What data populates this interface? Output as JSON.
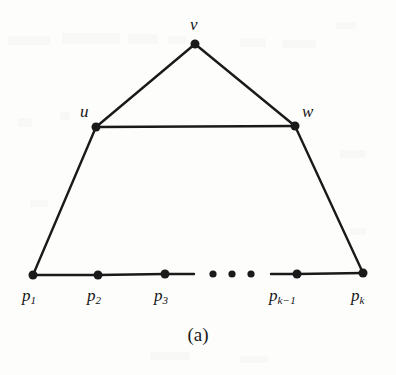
{
  "figure": {
    "caption": "(a)",
    "background_color": "#fdfdfc",
    "ink_color": "#1a1a1a",
    "nodes": [
      {
        "id": "v",
        "label": "v",
        "x": 195,
        "y": 44,
        "label_x": 190,
        "label_y": 16,
        "r": 4.5
      },
      {
        "id": "u",
        "label": "u",
        "x": 96,
        "y": 127,
        "label_x": 80,
        "label_y": 103,
        "r": 4.5
      },
      {
        "id": "w",
        "label": "w",
        "x": 295,
        "y": 126,
        "label_x": 302,
        "label_y": 103,
        "r": 4.5
      }
    ],
    "path_points": [
      {
        "id": "p1",
        "base": "p",
        "sub": "1",
        "x": 33,
        "y": 275,
        "label_x": 22,
        "label_y": 287,
        "r": 4.5
      },
      {
        "id": "p2",
        "base": "p",
        "sub": "2",
        "x": 98,
        "y": 275,
        "label_x": 87,
        "label_y": 287,
        "r": 4.5
      },
      {
        "id": "p3",
        "base": "p",
        "sub": "3",
        "x": 165,
        "y": 274,
        "label_x": 154,
        "label_y": 287,
        "r": 4.5
      },
      {
        "id": "pk-1",
        "base": "p",
        "sub": "k−1",
        "x": 297,
        "y": 274,
        "label_x": 269,
        "label_y": 287,
        "r": 4.5
      },
      {
        "id": "pk",
        "base": "p",
        "sub": "k",
        "x": 363,
        "y": 273,
        "label_x": 351,
        "label_y": 287,
        "r": 4.5
      }
    ],
    "ellipsis_dots": [
      {
        "x": 213,
        "y": 274,
        "r": 3.6
      },
      {
        "x": 232,
        "y": 274,
        "r": 3.6
      },
      {
        "x": 251,
        "y": 274,
        "r": 3.6
      }
    ],
    "edges": [
      {
        "id": "v-u",
        "from": "v",
        "to": "u",
        "x1": 195,
        "y1": 44,
        "x2": 96,
        "y2": 127
      },
      {
        "id": "v-w",
        "from": "v",
        "to": "w",
        "x1": 195,
        "y1": 44,
        "x2": 295,
        "y2": 126
      },
      {
        "id": "u-w",
        "from": "u",
        "to": "w",
        "x1": 96,
        "y1": 127,
        "x2": 295,
        "y2": 126
      },
      {
        "id": "u-p1",
        "from": "u",
        "to": "p1",
        "x1": 96,
        "y1": 127,
        "x2": 33,
        "y2": 275
      },
      {
        "id": "w-pk",
        "from": "w",
        "to": "pk",
        "x1": 295,
        "y1": 126,
        "x2": 363,
        "y2": 273
      },
      {
        "id": "p1-p2",
        "from": "p1",
        "to": "p2",
        "x1": 33,
        "y1": 275,
        "x2": 98,
        "y2": 275
      },
      {
        "id": "p2-p3",
        "from": "p2",
        "to": "p3",
        "x1": 98,
        "y1": 275,
        "x2": 165,
        "y2": 274
      },
      {
        "id": "p3-gap",
        "from": "p3",
        "to": "gap",
        "x1": 165,
        "y1": 274,
        "x2": 194,
        "y2": 274
      },
      {
        "id": "gap-pk-1",
        "from": "gap",
        "to": "pk-1",
        "x1": 271,
        "y1": 274,
        "x2": 297,
        "y2": 274
      },
      {
        "id": "pk-1-pk",
        "from": "pk-1",
        "to": "pk",
        "x1": 297,
        "y1": 274,
        "x2": 363,
        "y2": 273
      }
    ],
    "stroke_width": 2.4,
    "ghost_artifacts": [
      {
        "x": 8,
        "y": 36,
        "w": 42,
        "h": 9
      },
      {
        "x": 62,
        "y": 33,
        "w": 58,
        "h": 11
      },
      {
        "x": 128,
        "y": 34,
        "w": 30,
        "h": 10
      },
      {
        "x": 168,
        "y": 36,
        "w": 18,
        "h": 8
      },
      {
        "x": 240,
        "y": 38,
        "w": 26,
        "h": 9
      },
      {
        "x": 282,
        "y": 40,
        "w": 34,
        "h": 8
      },
      {
        "x": 336,
        "y": 22,
        "w": 20,
        "h": 7
      },
      {
        "x": 18,
        "y": 118,
        "w": 14,
        "h": 9
      },
      {
        "x": 60,
        "y": 112,
        "w": 10,
        "h": 8
      },
      {
        "x": 340,
        "y": 150,
        "w": 26,
        "h": 8
      },
      {
        "x": 30,
        "y": 200,
        "w": 18,
        "h": 7
      },
      {
        "x": 350,
        "y": 228,
        "w": 16,
        "h": 7
      },
      {
        "x": 150,
        "y": 352,
        "w": 40,
        "h": 8
      },
      {
        "x": 240,
        "y": 356,
        "w": 28,
        "h": 7
      }
    ]
  }
}
